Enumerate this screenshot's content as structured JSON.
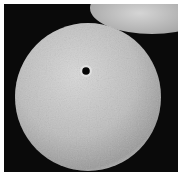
{
  "image": {
    "description": "Scanning electron micrograph of a spherical pollen grain with a single pore, a second grain partially visible at top right",
    "background_color": "#0a0a0a",
    "border_color": "#ffffff",
    "grain_color": "#c9c9c9"
  }
}
